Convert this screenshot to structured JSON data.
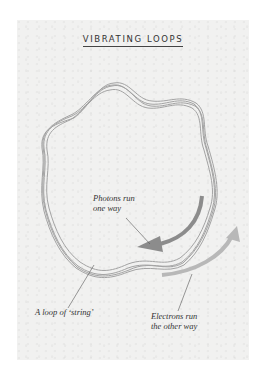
{
  "title": "VIBRATING LOOPS",
  "labels": {
    "photons_line1": "Photons run",
    "photons_line2": "one way",
    "loop": "A loop of ‘string’",
    "electrons_line1": "Electrons run",
    "electrons_line2": "the other way"
  },
  "colors": {
    "loop_stroke": "#9a9a9a",
    "arrow_photons": "#8c8c8c",
    "arrow_electrons": "#b8b8b8",
    "background": "#f1f1f0"
  }
}
